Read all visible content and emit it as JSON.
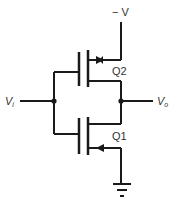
{
  "diagram": {
    "type": "CMOS inverter circuit",
    "supply_label": "− V",
    "input_label": {
      "main": "V",
      "sub": "i"
    },
    "output_label": {
      "main": "V",
      "sub": "o"
    },
    "transistors": [
      {
        "id": "Q2",
        "label": "Q2",
        "position": "top",
        "arrow": "source, pointing toward channel (right)"
      },
      {
        "id": "Q1",
        "label": "Q1",
        "position": "bottom",
        "arrow": "source, pointing toward channel (left)"
      }
    ],
    "ground": "ground-symbol",
    "colors": {
      "line": "#1a1a1a",
      "text": "#333333",
      "background": "#ffffff"
    }
  }
}
